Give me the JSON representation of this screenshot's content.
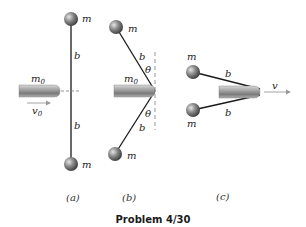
{
  "figure": {
    "title": "Problem 4/30",
    "panels": [
      {
        "caption": "(a)",
        "labels": {
          "mass_top": "m",
          "mass_bottom": "m",
          "rod_top": "b",
          "rod_bottom": "b",
          "bullet_mass": "m",
          "bullet_mass_sub": "0",
          "velocity": "v",
          "velocity_sub": "0"
        }
      },
      {
        "caption": "(b)",
        "labels": {
          "mass_top": "m",
          "mass_bottom": "m",
          "rod_top": "b",
          "rod_bottom": "b",
          "angle_top": "θ",
          "angle_bottom": "θ",
          "bullet_mass": "m",
          "bullet_mass_sub": "0"
        }
      },
      {
        "caption": "(c)",
        "labels": {
          "mass_top": "m",
          "mass_bottom": "m",
          "rod_top": "b",
          "rod_bottom": "b",
          "velocity": "v"
        }
      }
    ]
  },
  "colors": {
    "rod": "#1a1a1a",
    "dashed": "#8a8a8a",
    "arrow": "#9a9a9a",
    "ball": "#7a7a7a",
    "bullet": "#9c9c9c"
  }
}
